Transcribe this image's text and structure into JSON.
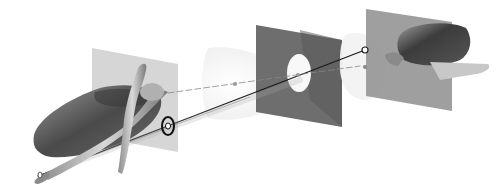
{
  "figure": {
    "colors": {
      "background": "#ffffff",
      "light_plane": "#b8b8b8",
      "dark_plane": "#6e6e6e",
      "right_plane": "#8a8a8a",
      "cone": "#eeeeee",
      "ray": "#1a1a1a",
      "object": "#5a5a5a"
    },
    "elements": [
      "left-bowl-object",
      "figure-sculpture",
      "left-translucent-plane",
      "target-marker",
      "left-cone",
      "dark-aperture-plane",
      "aperture-hole",
      "right-cone",
      "right-plane",
      "right-head-object",
      "projection-rays",
      "lens-tip"
    ]
  }
}
